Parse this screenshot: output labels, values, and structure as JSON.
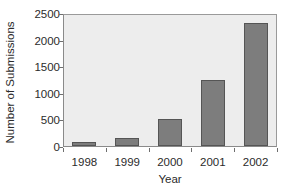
{
  "chart_data": {
    "type": "bar",
    "title": "",
    "xlabel": "Year",
    "ylabel": "Number of Submissions",
    "categories": [
      "1998",
      "1999",
      "2000",
      "2001",
      "2002"
    ],
    "values": [
      75,
      155,
      510,
      1240,
      2320
    ],
    "ylim": [
      0,
      2500
    ],
    "yticks": [
      0,
      500,
      1000,
      1500,
      2000,
      2500
    ],
    "ytick_labels": [
      "0",
      "500",
      "1000",
      "1500",
      "2000",
      "2500"
    ],
    "grid": false,
    "legend": false,
    "legend_position": "none",
    "series": [
      {
        "name": "Submissions",
        "values": [
          75,
          155,
          510,
          1240,
          2320
        ]
      }
    ],
    "colors": {
      "bar_fill": "#7d7d7d",
      "bar_edge": "#555555",
      "plot_background": "#ededed",
      "axis": "#6e6e6e",
      "text": "#2b2b2b",
      "figure_background": "#ffffff"
    }
  }
}
